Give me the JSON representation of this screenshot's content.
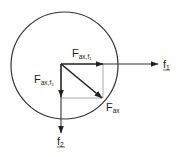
{
  "diagram": {
    "type": "vector-decomposition",
    "colors": {
      "stroke": "#333333",
      "thin": "#777777",
      "text": "#222222",
      "background": "#ffffff"
    },
    "circle": {
      "cx": 64.5,
      "cy": 65.5,
      "r": 53.5
    },
    "origin": {
      "x": 61,
      "y": 64
    },
    "vectors": [
      {
        "id": "F_ax_f1",
        "label_main": "F",
        "label_sub": "ax,f₁",
        "from": [
          61,
          64
        ],
        "to": [
          103,
          64
        ]
      },
      {
        "id": "F_ax_f2",
        "label_main": "F",
        "label_sub": "ax,f₂",
        "from": [
          61,
          64
        ],
        "to": [
          61,
          97
        ]
      },
      {
        "id": "F_ax",
        "label_main": "F",
        "label_sub": "ax",
        "from": [
          61,
          64
        ],
        "to": [
          102,
          98
        ]
      },
      {
        "id": "f1_axis",
        "label": "f₁",
        "from": [
          103,
          64
        ],
        "to": [
          158,
          64
        ]
      },
      {
        "id": "f2_axis",
        "label": "f₂",
        "from": [
          61,
          97
        ],
        "to": [
          61,
          133
        ]
      }
    ],
    "labels": {
      "f_ax_f1": {
        "main": "F",
        "sub": "ax,f₁"
      },
      "f_ax_f2": {
        "main": "F",
        "sub": "ax,f₂"
      },
      "f_ax": {
        "main": "F",
        "sub": "ax"
      },
      "f1": {
        "main": "f",
        "sub": "1"
      },
      "f2": {
        "main": "f",
        "sub": "2"
      }
    }
  }
}
